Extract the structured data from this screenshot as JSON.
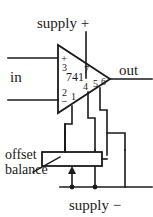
{
  "figure": {
    "kind": "circuit-schematic",
    "ink_color": "#1a1a1a",
    "background_color": "#ffffff"
  },
  "device": {
    "part_number": "741",
    "symbol": "triangle-opamp"
  },
  "terminals": {
    "supply_plus": "supply +",
    "supply_minus": "supply −",
    "input": "in",
    "output": "out"
  },
  "annotations": {
    "offset_line1": "offset",
    "offset_line2": "balance"
  },
  "polarity": {
    "noninverting": "+",
    "inverting": "−"
  },
  "pins": [
    {
      "number": "1",
      "name": "offset-null-1"
    },
    {
      "number": "2",
      "name": "inverting-input"
    },
    {
      "number": "3",
      "name": "noninverting-input"
    },
    {
      "number": "4",
      "name": "v-minus"
    },
    {
      "number": "5",
      "name": "offset-null-2"
    },
    {
      "number": "6",
      "name": "output"
    },
    {
      "number": "7",
      "name": "v-plus"
    }
  ],
  "components": {
    "potentiometer": {
      "label": "offset balance",
      "symbol": "rectangle-with-wiper-arrow"
    }
  }
}
